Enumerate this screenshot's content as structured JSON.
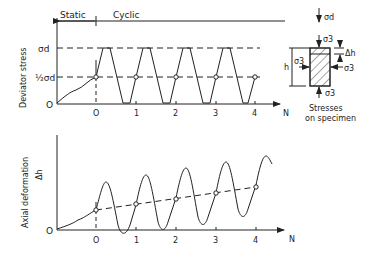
{
  "top_chart": {
    "phase_static": "Static",
    "phase_cyclic": "Cyclic",
    "ylabel": "Deviator stress",
    "y_ticks": {
      "sigma_d": "σd",
      "half_sigma_d": "½σd",
      "zero": "O"
    },
    "x_ticks": [
      "O",
      "1",
      "2",
      "3",
      "4"
    ],
    "x_axis_label": "N"
  },
  "bottom_chart": {
    "ylabel": "Axial deformation",
    "ylabel2": "Δh",
    "zero": "O",
    "x_ticks": [
      "O",
      "1",
      "2",
      "3",
      "4"
    ],
    "x_axis_label": "N"
  },
  "specimen": {
    "sigma_d": "σd",
    "sigma_3_top": "σ3",
    "sigma_3_left": "σ3",
    "sigma_3_right": "σ3",
    "sigma_3_bottom": "σ3",
    "delta_h": "Δh",
    "h": "h",
    "caption_line1": "Stresses",
    "caption_line2": "on specimen"
  },
  "colors": {
    "line": "#222222",
    "background": "#ffffff"
  }
}
